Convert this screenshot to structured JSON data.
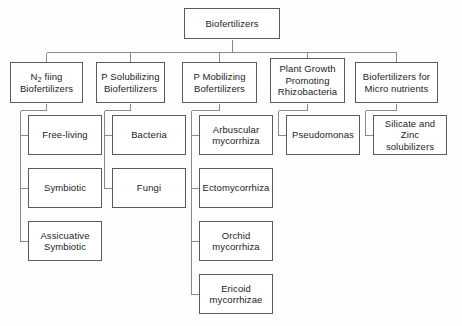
{
  "diagram": {
    "type": "hierarchical-tree",
    "canvas": {
      "width": 462,
      "height": 326
    },
    "style": {
      "background_color": "#fdfdfd",
      "box_fill": "#ffffff",
      "box_border_color": "#5a5a5a",
      "connector_color": "#8a8a8a",
      "text_color": "#1c1c1c"
    },
    "root": {
      "label": "Biofertilizers",
      "x": 184,
      "y": 8,
      "width": 96,
      "height": 31
    },
    "level2": [
      {
        "id": "n2-fixing",
        "label": "N2 fiing\nBiofertilizers",
        "label_line1_pre": "N",
        "label_line1_sub": "2",
        "label_line1_post": " fiing",
        "label_line2": "Biofertilizers",
        "x": 10,
        "y": 62,
        "width": 73,
        "height": 41
      },
      {
        "id": "p-solubilizing",
        "label": "P Solubilizing\nBiofertilizers",
        "x": 96,
        "y": 62,
        "width": 69,
        "height": 41
      },
      {
        "id": "p-mobilizing",
        "label": "P Mobilizing\nBofertilizers",
        "x": 182,
        "y": 62,
        "width": 75,
        "height": 41
      },
      {
        "id": "pgpr",
        "label": "Plant  Growth\nPromoting\nRhizobacteria",
        "x": 270,
        "y": 58,
        "width": 75,
        "height": 45
      },
      {
        "id": "micro-nutrients",
        "label": "Biofertilizers  for\nMicro nutrients",
        "x": 355,
        "y": 62,
        "width": 83,
        "height": 41
      }
    ],
    "level3": [
      {
        "id": "free-living",
        "parent": "n2-fixing",
        "label": "Free-living",
        "x": 28,
        "y": 115,
        "width": 74,
        "height": 40
      },
      {
        "id": "symbiotic",
        "parent": "n2-fixing",
        "label": "Symbiotic",
        "x": 28,
        "y": 168,
        "width": 74,
        "height": 40
      },
      {
        "id": "associative-symbiotic",
        "parent": "n2-fixing",
        "label": "Assicuative\nSymbiotic",
        "x": 28,
        "y": 221,
        "width": 74,
        "height": 40
      },
      {
        "id": "bacteria",
        "parent": "p-solubilizing",
        "label": "Bacteria",
        "x": 112,
        "y": 115,
        "width": 74,
        "height": 40
      },
      {
        "id": "fungi",
        "parent": "p-solubilizing",
        "label": "Fungi",
        "x": 112,
        "y": 168,
        "width": 74,
        "height": 40
      },
      {
        "id": "arbuscular",
        "parent": "p-mobilizing",
        "label": "Arbuscular\nmycorrhiza",
        "x": 199,
        "y": 115,
        "width": 74,
        "height": 40
      },
      {
        "id": "ectomycorrhiza",
        "parent": "p-mobilizing",
        "label": "Ectomycorrhiza",
        "x": 199,
        "y": 168,
        "width": 74,
        "height": 40
      },
      {
        "id": "orchid",
        "parent": "p-mobilizing",
        "label": "Orchid\nmycorrhiza",
        "x": 199,
        "y": 221,
        "width": 74,
        "height": 40
      },
      {
        "id": "ericoid",
        "parent": "p-mobilizing",
        "label": "Ericoid\nmycorrhizae",
        "x": 199,
        "y": 274,
        "width": 74,
        "height": 40
      },
      {
        "id": "pseudomonas",
        "parent": "pgpr",
        "label": "Pseudomonas",
        "x": 286,
        "y": 115,
        "width": 74,
        "height": 40
      },
      {
        "id": "silicate-zinc",
        "parent": "micro-nutrients",
        "label": "Silicate and Zinc\nsolubilizers",
        "x": 373,
        "y": 115,
        "width": 74,
        "height": 40
      }
    ]
  }
}
